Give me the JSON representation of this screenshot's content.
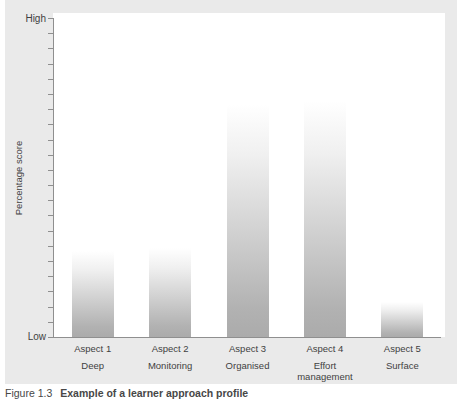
{
  "figure": {
    "background_color": "#eaeaea",
    "axis_color": "#8f8f8f",
    "text_color": "#3f3f3f",
    "y_axis": {
      "top_label": "High",
      "bottom_label": "Low",
      "axis_label": "Percentage score",
      "tick_count": 22
    },
    "caption": {
      "prefix": "Figure 1.3",
      "title": "Example of a learner approach profile"
    }
  },
  "chart_data": {
    "type": "bar",
    "title": "",
    "xlabel": "",
    "ylabel": "Percentage score",
    "y_axis_range": [
      "Low",
      "High"
    ],
    "grid": false,
    "legend": false,
    "categories": [
      "Aspect 1",
      "Aspect 2",
      "Aspect 3",
      "Aspect 4",
      "Aspect 5"
    ],
    "category_sublabels": [
      "Deep",
      "Monitoring",
      "Organised",
      "Effort management",
      "Surface"
    ],
    "series": [
      {
        "name": "Percentage score",
        "values_percent_of_axis": [
          27,
          28,
          73,
          74,
          11
        ]
      }
    ],
    "bar_color": "#ababab",
    "bar_style": "each bar fades from white at its top to solid gray at its base"
  }
}
